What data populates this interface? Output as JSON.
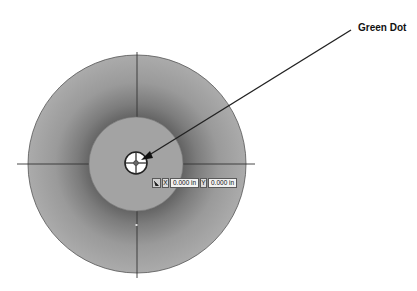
{
  "callout": {
    "label": "Green Dot"
  },
  "coordinate_widget": {
    "icon": "snap-arrow-icon",
    "x_label": "X",
    "x_value": "0.000 in",
    "y_label": "Y",
    "y_value": "0.000 in"
  },
  "colors": {
    "outer_ring_edge": "#a9a9a9",
    "outer_ring_shadow": "#666666",
    "inner_disc": "#a3a3a3",
    "outline": "#555555",
    "crosshair": "#333333",
    "target_fill": "#ffffff",
    "leader_line": "#222222"
  }
}
